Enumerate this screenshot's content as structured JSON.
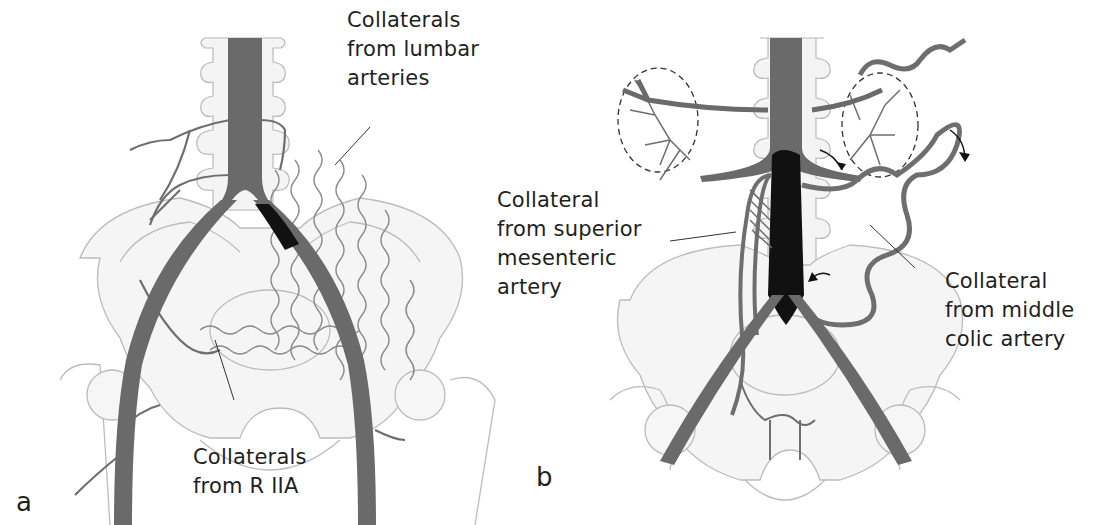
{
  "figure": {
    "panels": [
      {
        "id": "a",
        "letter": "a",
        "labels": [
          {
            "id": "lumbar",
            "lines": [
              "Collaterals",
              "from lumbar",
              "arteries"
            ]
          },
          {
            "id": "riia",
            "lines": [
              "Collaterals",
              "from R IIA"
            ]
          }
        ]
      },
      {
        "id": "b",
        "letter": "b",
        "labels": [
          {
            "id": "sma",
            "lines": [
              "Collateral",
              "from superior",
              "mesenteric",
              "artery"
            ]
          },
          {
            "id": "mca",
            "lines": [
              "Collateral",
              "from middle",
              "colic artery"
            ]
          }
        ]
      }
    ],
    "colors": {
      "artery": "#6e6e6e",
      "occluded": "#111111",
      "bone_outline": "#b5b5b5",
      "bone_fill": "#f3f3f3",
      "leader_line": "#333333",
      "text": "#1f1f1f"
    }
  }
}
